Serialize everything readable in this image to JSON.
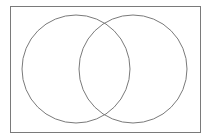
{
  "diagram": {
    "type": "venn",
    "background": "#ffffff",
    "stroke_color": "#7a7a7a",
    "frame": {
      "x": 10.5,
      "y": 6.5,
      "width": 190,
      "height": 126
    },
    "sets": [
      {
        "id": "set-a",
        "cx": 76,
        "cy": 69,
        "r": 54
      },
      {
        "id": "set-b",
        "cx": 133,
        "cy": 69,
        "r": 54
      }
    ]
  }
}
